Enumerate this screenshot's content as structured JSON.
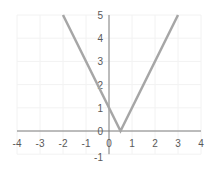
{
  "chart_data": {
    "type": "line",
    "title": "",
    "xlabel": "",
    "ylabel": "",
    "function": "y = |2x - 1|",
    "x": [
      -2,
      0,
      0.5,
      3
    ],
    "series": [
      {
        "name": "y = |2x - 1|",
        "x": [
          -2,
          0,
          0.5,
          3
        ],
        "values": [
          5,
          1,
          0,
          5
        ],
        "color": "#a6a6a6"
      }
    ],
    "xlim": [
      -4,
      4
    ],
    "ylim": [
      -1,
      5
    ],
    "x_ticks": [
      "-4",
      "-3",
      "-2",
      "-1",
      "0",
      "1",
      "2",
      "3",
      "4"
    ],
    "y_ticks": [
      "-1",
      "0",
      "1",
      "2",
      "3",
      "4",
      "5"
    ],
    "grid": true,
    "legend": "none",
    "axis_color": "#7f7f7f",
    "grid_color": "#f2f2f2"
  }
}
